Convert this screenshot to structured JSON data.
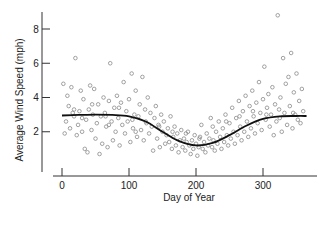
{
  "chart_data": {
    "type": "scatter",
    "title": "",
    "xlabel": "Day of Year",
    "ylabel": "Average Wind Speed (mph)",
    "xlim": [
      -10,
      370
    ],
    "ylim": [
      0,
      9
    ],
    "xticks": [
      0,
      100,
      200,
      300
    ],
    "yticks": [
      2,
      4,
      6,
      8
    ],
    "grid": false,
    "legend": null,
    "marker": "open-circle",
    "colors": {
      "points": "#8a8a8a",
      "smooth": "#111111",
      "axis": "#333333"
    },
    "series": [
      {
        "name": "Daily average wind speed",
        "type": "scatter",
        "note": "Approximately 365 daily observations; representative sample read from the plot",
        "points": [
          [
            2,
            4.8
          ],
          [
            4,
            1.9
          ],
          [
            6,
            2.6
          ],
          [
            8,
            4.1
          ],
          [
            10,
            3.5
          ],
          [
            12,
            2.2
          ],
          [
            14,
            4.6
          ],
          [
            16,
            3.1
          ],
          [
            18,
            2.9
          ],
          [
            20,
            6.3
          ],
          [
            22,
            1.8
          ],
          [
            24,
            2.4
          ],
          [
            26,
            3.2
          ],
          [
            28,
            4.4
          ],
          [
            30,
            2.0
          ],
          [
            32,
            3.9
          ],
          [
            34,
            1.0
          ],
          [
            36,
            2.7
          ],
          [
            38,
            0.8
          ],
          [
            40,
            3.3
          ],
          [
            42,
            4.7
          ],
          [
            44,
            2.1
          ],
          [
            46,
            3.0
          ],
          [
            48,
            4.5
          ],
          [
            50,
            1.6
          ],
          [
            52,
            2.5
          ],
          [
            54,
            3.6
          ],
          [
            56,
            0.7
          ],
          [
            58,
            2.9
          ],
          [
            60,
            1.3
          ],
          [
            62,
            4.0
          ],
          [
            64,
            3.1
          ],
          [
            66,
            2.3
          ],
          [
            68,
            1.1
          ],
          [
            70,
            3.8
          ],
          [
            72,
            6.0
          ],
          [
            74,
            2.6
          ],
          [
            76,
            1.5
          ],
          [
            78,
            3.4
          ],
          [
            80,
            2.0
          ],
          [
            82,
            4.1
          ],
          [
            84,
            2.8
          ],
          [
            86,
            1.2
          ],
          [
            88,
            3.7
          ],
          [
            90,
            2.4
          ],
          [
            92,
            4.9
          ],
          [
            94,
            1.9
          ],
          [
            96,
            3.2
          ],
          [
            98,
            2.6
          ],
          [
            100,
            3.9
          ],
          [
            102,
            1.4
          ],
          [
            104,
            5.4
          ],
          [
            106,
            2.2
          ],
          [
            108,
            3.0
          ],
          [
            110,
            4.4
          ],
          [
            112,
            1.7
          ],
          [
            114,
            2.9
          ],
          [
            116,
            3.6
          ],
          [
            118,
            2.1
          ],
          [
            120,
            5.2
          ],
          [
            122,
            1.5
          ],
          [
            124,
            3.3
          ],
          [
            126,
            2.5
          ],
          [
            128,
            4.0
          ],
          [
            130,
            1.9
          ],
          [
            132,
            3.1
          ],
          [
            134,
            2.3
          ],
          [
            136,
            0.9
          ],
          [
            138,
            2.8
          ],
          [
            140,
            3.5
          ],
          [
            142,
            1.6
          ],
          [
            144,
            2.4
          ],
          [
            146,
            1.1
          ],
          [
            148,
            3.0
          ],
          [
            150,
            2.0
          ],
          [
            152,
            2.6
          ],
          [
            154,
            1.3
          ],
          [
            156,
            1.8
          ],
          [
            158,
            2.2
          ],
          [
            160,
            1.4
          ],
          [
            162,
            2.9
          ],
          [
            164,
            1.0
          ],
          [
            166,
            1.7
          ],
          [
            168,
            2.3
          ],
          [
            170,
            1.2
          ],
          [
            172,
            1.9
          ],
          [
            174,
            0.8
          ],
          [
            176,
            1.5
          ],
          [
            178,
            2.1
          ],
          [
            180,
            1.1
          ],
          [
            182,
            1.6
          ],
          [
            184,
            0.9
          ],
          [
            186,
            1.4
          ],
          [
            188,
            2.0
          ],
          [
            190,
            1.2
          ],
          [
            192,
            0.7
          ],
          [
            194,
            1.5
          ],
          [
            196,
            1.0
          ],
          [
            198,
            1.8
          ],
          [
            200,
            1.3
          ],
          [
            202,
            0.6
          ],
          [
            204,
            1.1
          ],
          [
            206,
            1.7
          ],
          [
            208,
            2.4
          ],
          [
            210,
            1.0
          ],
          [
            212,
            1.4
          ],
          [
            214,
            0.8
          ],
          [
            216,
            1.9
          ],
          [
            218,
            1.2
          ],
          [
            220,
            1.6
          ],
          [
            222,
            2.8
          ],
          [
            224,
            1.1
          ],
          [
            226,
            1.5
          ],
          [
            228,
            0.9
          ],
          [
            230,
            2.0
          ],
          [
            232,
            1.3
          ],
          [
            234,
            2.6
          ],
          [
            236,
            1.7
          ],
          [
            238,
            1.0
          ],
          [
            240,
            2.2
          ],
          [
            242,
            1.4
          ],
          [
            244,
            3.0
          ],
          [
            246,
            1.8
          ],
          [
            248,
            1.2
          ],
          [
            250,
            2.5
          ],
          [
            252,
            1.6
          ],
          [
            254,
            3.4
          ],
          [
            256,
            2.0
          ],
          [
            258,
            1.3
          ],
          [
            260,
            2.8
          ],
          [
            262,
            1.8
          ],
          [
            264,
            3.8
          ],
          [
            266,
            2.3
          ],
          [
            268,
            1.5
          ],
          [
            270,
            3.2
          ],
          [
            272,
            2.0
          ],
          [
            274,
            4.1
          ],
          [
            276,
            2.6
          ],
          [
            278,
            1.7
          ],
          [
            280,
            3.5
          ],
          [
            282,
            2.2
          ],
          [
            284,
            4.4
          ],
          [
            286,
            2.9
          ],
          [
            288,
            1.9
          ],
          [
            290,
            3.7
          ],
          [
            292,
            2.5
          ],
          [
            294,
            4.9
          ],
          [
            296,
            3.1
          ],
          [
            298,
            2.1
          ],
          [
            300,
            3.9
          ],
          [
            302,
            5.8
          ],
          [
            304,
            2.7
          ],
          [
            306,
            3.4
          ],
          [
            308,
            4.2
          ],
          [
            310,
            2.3
          ],
          [
            312,
            3.0
          ],
          [
            314,
            4.6
          ],
          [
            316,
            1.8
          ],
          [
            318,
            3.6
          ],
          [
            320,
            2.6
          ],
          [
            322,
            8.8
          ],
          [
            324,
            3.3
          ],
          [
            326,
            4.0
          ],
          [
            328,
            2.0
          ],
          [
            330,
            6.3
          ],
          [
            332,
            3.1
          ],
          [
            334,
            4.8
          ],
          [
            336,
            2.4
          ],
          [
            338,
            5.2
          ],
          [
            340,
            3.5
          ],
          [
            342,
            6.6
          ],
          [
            344,
            2.2
          ],
          [
            346,
            4.3
          ],
          [
            348,
            3.0
          ],
          [
            350,
            5.4
          ],
          [
            352,
            2.7
          ],
          [
            354,
            3.8
          ],
          [
            356,
            2.5
          ],
          [
            358,
            4.5
          ],
          [
            360,
            3.2
          ],
          [
            18,
            3.3
          ],
          [
            45,
            3.6
          ],
          [
            65,
            2.9
          ],
          [
            85,
            3.4
          ],
          [
            105,
            2.7
          ],
          [
            125,
            2.6
          ],
          [
            145,
            2.3
          ],
          [
            165,
            2.0
          ],
          [
            185,
            1.9
          ],
          [
            205,
            1.6
          ],
          [
            225,
            2.3
          ],
          [
            245,
            2.6
          ],
          [
            265,
            2.9
          ],
          [
            285,
            3.2
          ],
          [
            305,
            3.0
          ],
          [
            325,
            2.8
          ],
          [
            345,
            3.1
          ],
          [
            30,
            2.8
          ],
          [
            70,
            2.4
          ],
          [
            110,
            2.0
          ]
        ]
      },
      {
        "name": "Smooth trend",
        "type": "line",
        "x": [
          0,
          25,
          50,
          75,
          100,
          125,
          150,
          175,
          200,
          225,
          250,
          275,
          300,
          325,
          350,
          365
        ],
        "y": [
          2.95,
          2.98,
          3.0,
          2.98,
          2.9,
          2.6,
          2.0,
          1.45,
          1.2,
          1.35,
          1.8,
          2.35,
          2.75,
          2.9,
          2.92,
          2.92
        ]
      }
    ]
  }
}
